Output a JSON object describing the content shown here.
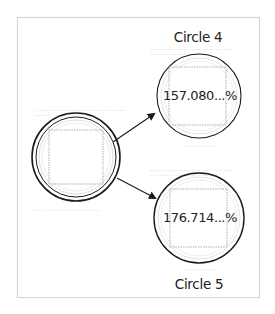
{
  "diagram": {
    "source": {
      "label": ""
    },
    "targets": [
      {
        "name": "Circle 4",
        "value_label": "157.080...%"
      },
      {
        "name": "Circle 5",
        "value_label": "176.714...%"
      }
    ],
    "colors": {
      "stroke": "#1a1a1a",
      "faint": "#bdbdbd",
      "frame": "#d4d4d4"
    }
  }
}
